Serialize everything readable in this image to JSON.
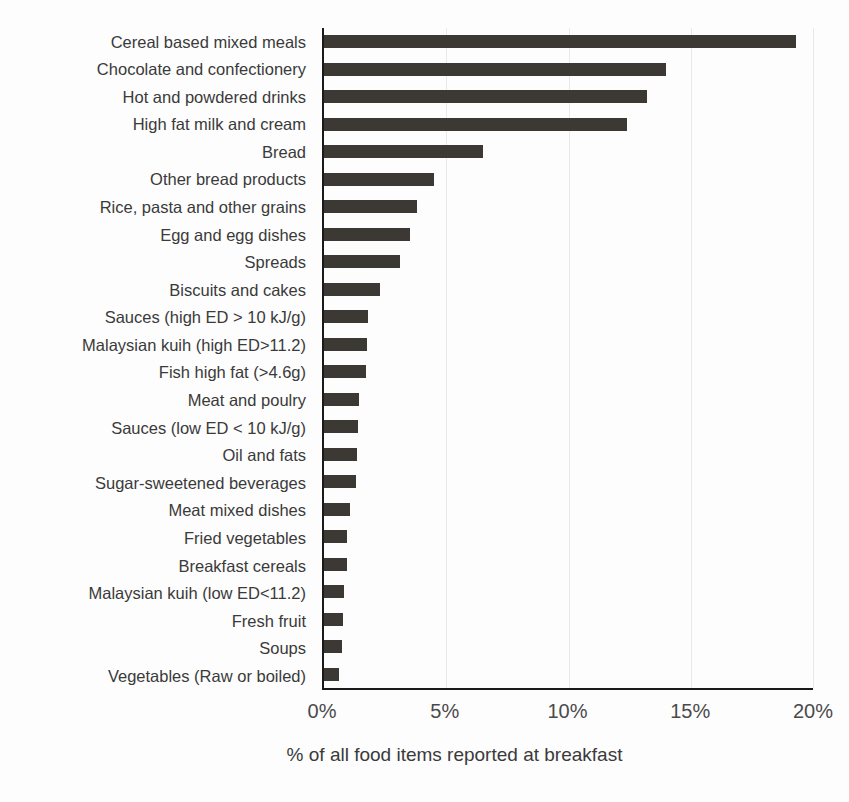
{
  "chart_data": {
    "type": "bar",
    "orientation": "horizontal",
    "title": "",
    "xlabel": "% of all food items reported at breakfast",
    "ylabel": "",
    "xlim": [
      0,
      20
    ],
    "xtick_labels": [
      "0%",
      "5%",
      "10%",
      "15%",
      "20%"
    ],
    "xtick_values": [
      0,
      5,
      10,
      15,
      20
    ],
    "grid": "vertical",
    "legend": "none",
    "bar_color": "#3c3935",
    "categories": [
      "Cereal based mixed meals",
      "Chocolate and confectionery",
      "Hot and powdered drinks",
      "High fat milk and cream",
      "Bread",
      "Other bread products",
      "Rice, pasta and other grains",
      "Egg and egg dishes",
      "Spreads",
      "Biscuits and cakes",
      "Sauces (high ED > 10 kJ/g)",
      "Malaysian kuih (high ED>11.2)",
      "Fish high fat (>4.6g)",
      "Meat and poulry",
      "Sauces (low ED < 10 kJ/g)",
      "Oil and fats",
      "Sugar-sweetened beverages",
      "Meat mixed dishes",
      "Fried vegetables",
      "Breakfast cereals",
      "Malaysian kuih (low ED<11.2)",
      "Fresh fruit",
      "Soups",
      "Vegetables (Raw or boiled)"
    ],
    "values": [
      19.3,
      14.0,
      13.2,
      12.4,
      6.5,
      4.5,
      3.8,
      3.5,
      3.1,
      2.3,
      1.8,
      1.75,
      1.7,
      1.45,
      1.4,
      1.35,
      1.3,
      1.05,
      0.95,
      0.95,
      0.8,
      0.78,
      0.72,
      0.6
    ]
  }
}
